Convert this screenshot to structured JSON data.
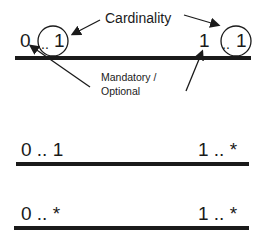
{
  "diagram": {
    "annotations": {
      "cardinality": "Cardinality",
      "mandatory_optional": "Mandatory /\nOptional"
    },
    "rows": [
      {
        "left": {
          "min": "0",
          "sep": "..",
          "max": "1"
        },
        "right": {
          "min": "1",
          "sep": "..",
          "max": "1"
        }
      },
      {
        "left_text": "0 .. 1",
        "right_text": "1 .. *"
      },
      {
        "left_text": "0 .. *",
        "right_text": "1 .. *"
      }
    ],
    "colors": {
      "ink": "#1a1a1a",
      "background": "#ffffff"
    }
  }
}
